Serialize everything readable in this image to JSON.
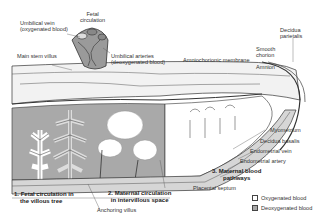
{
  "diagram": {
    "type": "anatomical-illustration",
    "colors": {
      "oxygenated": "#ffffff",
      "deoxygenated": "#a9a9a9",
      "outline": "#333333",
      "tissue": "#d6d6d6"
    }
  },
  "labels": {
    "umbilical_vein": [
      "Umbilical vein",
      "(oxygenated blood)"
    ],
    "fetal_circulation": [
      "Fetal",
      "circulation"
    ],
    "main_stem_villus": "Main stem villus",
    "umbilical_arteries": [
      "Umbilical arteries",
      "(deoxygenated blood)"
    ],
    "amniochorionic_membrane": "Amniochorionic membrane",
    "smooth_chorion": [
      "Smooth",
      "chorion"
    ],
    "amnion": "Amnion",
    "decidua_parietalis": [
      "Decidua",
      "parietalis"
    ],
    "myometrium": "Myometrium",
    "decidua_basalis": "Decidua basalis",
    "endometrial_vein": "Endometrial vein",
    "endometrial_artery": "Endometrial artery",
    "placental_septum": "Placental septum",
    "anchoring_villus": "Anchoring villus"
  },
  "sections": [
    {
      "number": "1.",
      "title": [
        "Fetal circulation in",
        "the villous tree"
      ]
    },
    {
      "number": "2.",
      "title": [
        "Maternal circulation",
        "in intervillous space"
      ]
    },
    {
      "number": "3.",
      "title": [
        "Maternal blood",
        "pathways"
      ]
    }
  ],
  "legend": [
    {
      "label": "Oxygenated blood",
      "color": "#ffffff"
    },
    {
      "label": "Deoxygenated blood",
      "color": "#a9a9a9"
    }
  ]
}
